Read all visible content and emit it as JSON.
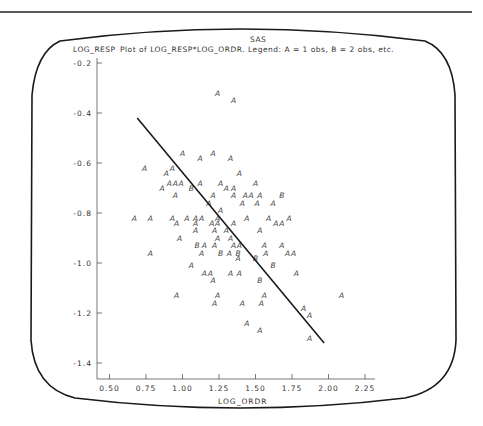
{
  "header": {
    "program": "SAS",
    "y_var_label": "LOG_RESP",
    "plot_title": "Plot of LOG_RESP*LOG_ORDR.  Legend: A = 1 obs, B = 2 obs, etc."
  },
  "colors": {
    "ink": "#222222",
    "axis": "#555555",
    "frame": "#1a1a1a",
    "background": "#ffffff"
  },
  "chart_data": {
    "type": "scatter",
    "xlabel": "LOG_ORDR",
    "ylabel": "LOG_RESP",
    "xlim": [
      0.4,
      2.3
    ],
    "ylim": [
      -1.46,
      -0.2
    ],
    "x_ticks": [
      0.5,
      0.75,
      1.0,
      1.25,
      1.5,
      1.75,
      2.0,
      2.25
    ],
    "x_tick_labels": [
      "0.50",
      "0.75",
      "1.00",
      "1.25",
      "1.50",
      "1.75",
      "2.00",
      "2.25"
    ],
    "y_ticks": [
      -0.2,
      -0.4,
      -0.6,
      -0.8,
      -1.0,
      -1.2,
      -1.4
    ],
    "y_tick_labels": [
      "-0.2",
      "-0.4",
      "-0.6",
      "-0.8",
      "-1.0",
      "-1.2",
      "-1.4"
    ],
    "grid": false,
    "legend": {
      "A": "1 obs",
      "B": "2 obs"
    },
    "points": [
      {
        "x": 1.24,
        "y": -0.32,
        "sym": "A"
      },
      {
        "x": 1.35,
        "y": -0.35,
        "sym": "A"
      },
      {
        "x": 1.0,
        "y": -0.56,
        "sym": "A"
      },
      {
        "x": 1.21,
        "y": -0.56,
        "sym": "A"
      },
      {
        "x": 1.12,
        "y": -0.58,
        "sym": "A"
      },
      {
        "x": 1.33,
        "y": -0.58,
        "sym": "A"
      },
      {
        "x": 0.74,
        "y": -0.62,
        "sym": "A"
      },
      {
        "x": 0.93,
        "y": -0.62,
        "sym": "A"
      },
      {
        "x": 0.89,
        "y": -0.64,
        "sym": "A"
      },
      {
        "x": 1.39,
        "y": -0.64,
        "sym": "A"
      },
      {
        "x": 0.91,
        "y": -0.68,
        "sym": "A"
      },
      {
        "x": 0.95,
        "y": -0.68,
        "sym": "A"
      },
      {
        "x": 0.99,
        "y": -0.68,
        "sym": "A"
      },
      {
        "x": 1.12,
        "y": -0.68,
        "sym": "A"
      },
      {
        "x": 1.26,
        "y": -0.68,
        "sym": "A"
      },
      {
        "x": 1.5,
        "y": -0.68,
        "sym": "A"
      },
      {
        "x": 0.86,
        "y": -0.7,
        "sym": "A"
      },
      {
        "x": 1.06,
        "y": -0.7,
        "sym": "B"
      },
      {
        "x": 1.3,
        "y": -0.7,
        "sym": "A"
      },
      {
        "x": 1.35,
        "y": -0.7,
        "sym": "A"
      },
      {
        "x": 0.95,
        "y": -0.73,
        "sym": "A"
      },
      {
        "x": 1.21,
        "y": -0.73,
        "sym": "A"
      },
      {
        "x": 1.35,
        "y": -0.73,
        "sym": "A"
      },
      {
        "x": 1.43,
        "y": -0.73,
        "sym": "A"
      },
      {
        "x": 1.47,
        "y": -0.73,
        "sym": "A"
      },
      {
        "x": 1.53,
        "y": -0.73,
        "sym": "A"
      },
      {
        "x": 1.68,
        "y": -0.73,
        "sym": "B"
      },
      {
        "x": 1.18,
        "y": -0.76,
        "sym": "A"
      },
      {
        "x": 1.41,
        "y": -0.76,
        "sym": "A"
      },
      {
        "x": 1.51,
        "y": -0.76,
        "sym": "A"
      },
      {
        "x": 1.62,
        "y": -0.76,
        "sym": "A"
      },
      {
        "x": 1.26,
        "y": -0.79,
        "sym": "A"
      },
      {
        "x": 0.67,
        "y": -0.82,
        "sym": "A"
      },
      {
        "x": 0.78,
        "y": -0.82,
        "sym": "A"
      },
      {
        "x": 0.93,
        "y": -0.82,
        "sym": "A"
      },
      {
        "x": 1.03,
        "y": -0.82,
        "sym": "A"
      },
      {
        "x": 1.09,
        "y": -0.82,
        "sym": "A"
      },
      {
        "x": 1.13,
        "y": -0.82,
        "sym": "A"
      },
      {
        "x": 1.24,
        "y": -0.82,
        "sym": "A"
      },
      {
        "x": 1.44,
        "y": -0.82,
        "sym": "A"
      },
      {
        "x": 1.59,
        "y": -0.82,
        "sym": "A"
      },
      {
        "x": 1.73,
        "y": -0.82,
        "sym": "A"
      },
      {
        "x": 0.96,
        "y": -0.84,
        "sym": "A"
      },
      {
        "x": 1.09,
        "y": -0.84,
        "sym": "A"
      },
      {
        "x": 1.2,
        "y": -0.84,
        "sym": "A"
      },
      {
        "x": 1.24,
        "y": -0.84,
        "sym": "A"
      },
      {
        "x": 1.35,
        "y": -0.84,
        "sym": "A"
      },
      {
        "x": 1.64,
        "y": -0.84,
        "sym": "A"
      },
      {
        "x": 1.68,
        "y": -0.84,
        "sym": "A"
      },
      {
        "x": 1.09,
        "y": -0.87,
        "sym": "A"
      },
      {
        "x": 1.22,
        "y": -0.87,
        "sym": "A"
      },
      {
        "x": 1.3,
        "y": -0.87,
        "sym": "A"
      },
      {
        "x": 1.53,
        "y": -0.87,
        "sym": "A"
      },
      {
        "x": 0.98,
        "y": -0.9,
        "sym": "A"
      },
      {
        "x": 1.24,
        "y": -0.9,
        "sym": "A"
      },
      {
        "x": 1.33,
        "y": -0.9,
        "sym": "A"
      },
      {
        "x": 1.1,
        "y": -0.93,
        "sym": "B"
      },
      {
        "x": 1.15,
        "y": -0.93,
        "sym": "A"
      },
      {
        "x": 1.22,
        "y": -0.93,
        "sym": "A"
      },
      {
        "x": 1.35,
        "y": -0.93,
        "sym": "A"
      },
      {
        "x": 1.39,
        "y": -0.93,
        "sym": "A"
      },
      {
        "x": 1.56,
        "y": -0.93,
        "sym": "A"
      },
      {
        "x": 1.68,
        "y": -0.93,
        "sym": "A"
      },
      {
        "x": 0.78,
        "y": -0.96,
        "sym": "A"
      },
      {
        "x": 1.13,
        "y": -0.96,
        "sym": "A"
      },
      {
        "x": 1.26,
        "y": -0.96,
        "sym": "B"
      },
      {
        "x": 1.32,
        "y": -0.96,
        "sym": "A"
      },
      {
        "x": 1.38,
        "y": -0.96,
        "sym": "B"
      },
      {
        "x": 1.57,
        "y": -0.96,
        "sym": "A"
      },
      {
        "x": 1.72,
        "y": -0.96,
        "sym": "A"
      },
      {
        "x": 1.76,
        "y": -0.96,
        "sym": "A"
      },
      {
        "x": 1.38,
        "y": -0.98,
        "sym": "A"
      },
      {
        "x": 1.5,
        "y": -0.98,
        "sym": "B"
      },
      {
        "x": 1.06,
        "y": -1.01,
        "sym": "A"
      },
      {
        "x": 1.62,
        "y": -1.01,
        "sym": "B"
      },
      {
        "x": 1.15,
        "y": -1.04,
        "sym": "A"
      },
      {
        "x": 1.19,
        "y": -1.04,
        "sym": "A"
      },
      {
        "x": 1.33,
        "y": -1.04,
        "sym": "A"
      },
      {
        "x": 1.39,
        "y": -1.04,
        "sym": "A"
      },
      {
        "x": 1.78,
        "y": -1.04,
        "sym": "A"
      },
      {
        "x": 1.21,
        "y": -1.07,
        "sym": "A"
      },
      {
        "x": 1.53,
        "y": -1.07,
        "sym": "B"
      },
      {
        "x": 0.96,
        "y": -1.13,
        "sym": "A"
      },
      {
        "x": 1.24,
        "y": -1.13,
        "sym": "A"
      },
      {
        "x": 1.56,
        "y": -1.13,
        "sym": "A"
      },
      {
        "x": 2.09,
        "y": -1.13,
        "sym": "A"
      },
      {
        "x": 1.22,
        "y": -1.16,
        "sym": "A"
      },
      {
        "x": 1.41,
        "y": -1.16,
        "sym": "A"
      },
      {
        "x": 1.54,
        "y": -1.16,
        "sym": "A"
      },
      {
        "x": 1.83,
        "y": -1.18,
        "sym": "A"
      },
      {
        "x": 1.87,
        "y": -1.21,
        "sym": "A"
      },
      {
        "x": 1.44,
        "y": -1.24,
        "sym": "A"
      },
      {
        "x": 1.53,
        "y": -1.27,
        "sym": "A"
      },
      {
        "x": 1.87,
        "y": -1.3,
        "sym": "A"
      }
    ],
    "regression_line": {
      "x": [
        0.69,
        1.97
      ],
      "y": [
        -0.42,
        -1.32
      ]
    }
  }
}
